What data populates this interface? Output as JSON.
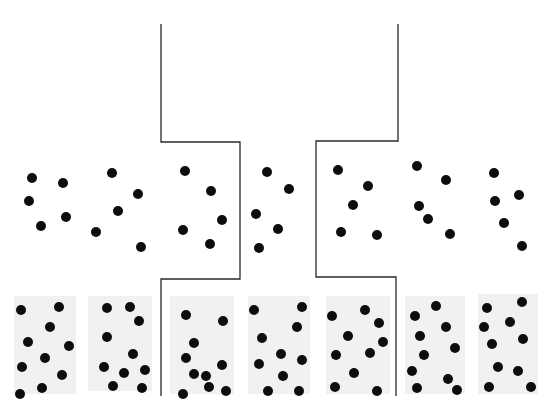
{
  "diagram": {
    "width": 556,
    "height": 414,
    "colors": {
      "background": "#ffffff",
      "dot": "#0d0d0d",
      "line": "#2a2a2a",
      "stipple": "#ececec"
    },
    "dot_radius": 5,
    "boundaries": [
      {
        "name": "left-channel-wall",
        "points": [
          [
            161,
            24
          ],
          [
            161,
            142
          ],
          [
            240,
            142
          ],
          [
            240,
            279
          ],
          [
            161,
            279
          ],
          [
            161,
            396
          ]
        ]
      },
      {
        "name": "right-channel-wall",
        "points": [
          [
            398,
            24
          ],
          [
            398,
            141
          ],
          [
            316,
            141
          ],
          [
            316,
            277
          ],
          [
            396,
            277
          ],
          [
            396,
            396
          ]
        ]
      }
    ],
    "stipple_regions": [
      {
        "x": 14,
        "y": 296,
        "w": 62,
        "h": 98
      },
      {
        "x": 88,
        "y": 296,
        "w": 64,
        "h": 95
      },
      {
        "x": 170,
        "y": 296,
        "w": 64,
        "h": 98
      },
      {
        "x": 248,
        "y": 296,
        "w": 62,
        "h": 98
      },
      {
        "x": 326,
        "y": 296,
        "w": 64,
        "h": 98
      },
      {
        "x": 405,
        "y": 296,
        "w": 60,
        "h": 98
      },
      {
        "x": 478,
        "y": 294,
        "w": 60,
        "h": 100
      }
    ],
    "rows": [
      {
        "name": "middle-row",
        "groups": [
          {
            "dots": [
              [
                32,
                178
              ],
              [
                63,
                183
              ],
              [
                29,
                201
              ],
              [
                66,
                217
              ],
              [
                41,
                226
              ]
            ]
          },
          {
            "dots": [
              [
                112,
                173
              ],
              [
                138,
                194
              ],
              [
                118,
                211
              ],
              [
                96,
                232
              ],
              [
                141,
                247
              ]
            ]
          },
          {
            "dots": [
              [
                185,
                171
              ],
              [
                211,
                191
              ],
              [
                222,
                220
              ],
              [
                183,
                230
              ],
              [
                210,
                244
              ]
            ]
          },
          {
            "dots": [
              [
                267,
                172
              ],
              [
                289,
                189
              ],
              [
                256,
                214
              ],
              [
                278,
                229
              ],
              [
                259,
                248
              ]
            ]
          },
          {
            "dots": [
              [
                338,
                170
              ],
              [
                368,
                186
              ],
              [
                353,
                205
              ],
              [
                341,
                232
              ],
              [
                377,
                235
              ]
            ]
          },
          {
            "dots": [
              [
                417,
                166
              ],
              [
                446,
                180
              ],
              [
                419,
                206
              ],
              [
                428,
                219
              ],
              [
                450,
                234
              ]
            ]
          },
          {
            "dots": [
              [
                494,
                173
              ],
              [
                519,
                195
              ],
              [
                495,
                201
              ],
              [
                504,
                223
              ],
              [
                522,
                246
              ]
            ]
          }
        ]
      },
      {
        "name": "bottom-row",
        "groups": [
          {
            "dots": [
              [
                21,
                310
              ],
              [
                59,
                307
              ],
              [
                50,
                327
              ],
              [
                28,
                342
              ],
              [
                69,
                346
              ],
              [
                45,
                358
              ],
              [
                22,
                367
              ],
              [
                62,
                375
              ],
              [
                20,
                394
              ],
              [
                42,
                388
              ]
            ]
          },
          {
            "dots": [
              [
                107,
                308
              ],
              [
                130,
                307
              ],
              [
                139,
                321
              ],
              [
                107,
                337
              ],
              [
                133,
                354
              ],
              [
                104,
                367
              ],
              [
                124,
                373
              ],
              [
                145,
                370
              ],
              [
                113,
                386
              ],
              [
                142,
                388
              ]
            ]
          },
          {
            "dots": [
              [
                186,
                315
              ],
              [
                223,
                321
              ],
              [
                194,
                343
              ],
              [
                186,
                358
              ],
              [
                222,
                365
              ],
              [
                194,
                374
              ],
              [
                206,
                376
              ],
              [
                209,
                387
              ],
              [
                183,
                394
              ],
              [
                226,
                391
              ]
            ]
          },
          {
            "dots": [
              [
                254,
                310
              ],
              [
                302,
                307
              ],
              [
                297,
                327
              ],
              [
                262,
                338
              ],
              [
                281,
                354
              ],
              [
                302,
                360
              ],
              [
                259,
                364
              ],
              [
                283,
                376
              ],
              [
                268,
                391
              ],
              [
                299,
                391
              ]
            ]
          },
          {
            "dots": [
              [
                332,
                316
              ],
              [
                365,
                310
              ],
              [
                379,
                323
              ],
              [
                348,
                336
              ],
              [
                383,
                342
              ],
              [
                336,
                355
              ],
              [
                370,
                353
              ],
              [
                354,
                373
              ],
              [
                335,
                387
              ],
              [
                377,
                391
              ]
            ]
          },
          {
            "dots": [
              [
                415,
                316
              ],
              [
                436,
                306
              ],
              [
                446,
                327
              ],
              [
                420,
                336
              ],
              [
                455,
                348
              ],
              [
                424,
                355
              ],
              [
                412,
                371
              ],
              [
                448,
                379
              ],
              [
                417,
                388
              ],
              [
                457,
                390
              ]
            ]
          },
          {
            "dots": [
              [
                487,
                308
              ],
              [
                522,
                302
              ],
              [
                484,
                327
              ],
              [
                510,
                322
              ],
              [
                492,
                344
              ],
              [
                523,
                339
              ],
              [
                498,
                367
              ],
              [
                518,
                371
              ],
              [
                489,
                387
              ],
              [
                531,
                387
              ]
            ]
          }
        ]
      }
    ]
  }
}
